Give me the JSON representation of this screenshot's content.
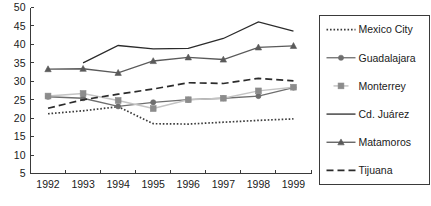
{
  "chart_data": {
    "type": "line",
    "title": "",
    "xlabel": "",
    "ylabel": "",
    "categories": [
      "1992",
      "1993",
      "1994",
      "1995",
      "1996",
      "1997",
      "1998",
      "1999"
    ],
    "x": [
      1992,
      1993,
      1994,
      1995,
      1996,
      1997,
      1998,
      1999
    ],
    "ylim": [
      5,
      50
    ],
    "yticks": [
      5,
      10,
      15,
      20,
      25,
      30,
      35,
      40,
      45,
      50
    ],
    "ytick_labels": [
      "5",
      "10",
      "15",
      "20",
      "25",
      "30",
      "35",
      "40",
      "45",
      "50"
    ],
    "grid": false,
    "legend_position": "right",
    "series": [
      {
        "name": "Mexico City",
        "values": [
          21.2,
          22.0,
          23.1,
          18.5,
          18.4,
          18.9,
          19.4,
          19.8
        ],
        "color": "#3a3a3a",
        "line_style": "dotted",
        "marker": "none"
      },
      {
        "name": "Guadalajara",
        "values": [
          25.8,
          25.4,
          23.2,
          24.3,
          25.0,
          25.4,
          26.0,
          28.3
        ],
        "color": "#6e6e6e",
        "line_style": "solid",
        "marker": "circle"
      },
      {
        "name": "Monterrey",
        "values": [
          26.0,
          26.7,
          24.8,
          22.6,
          25.0,
          25.4,
          27.4,
          28.4
        ],
        "color": "#c4c4c4",
        "line_style": "solid",
        "marker": "square"
      },
      {
        "name": "Cd. Juárez",
        "values": [
          null,
          35.0,
          39.7,
          38.8,
          38.9,
          41.6,
          46.1,
          43.6
        ],
        "color": "#2b2b2b",
        "line_style": "solid",
        "marker": "none"
      },
      {
        "name": "Matamoros",
        "values": [
          33.3,
          33.4,
          32.3,
          35.5,
          36.5,
          35.9,
          39.2,
          39.6
        ],
        "color": "#5a5a5a",
        "line_style": "solid",
        "marker": "triangle"
      },
      {
        "name": "Tijuana",
        "values": [
          22.7,
          25.0,
          26.5,
          27.9,
          29.6,
          29.4,
          30.8,
          30.1
        ],
        "color": "#2b2b2b",
        "line_style": "dashed",
        "marker": "none"
      }
    ]
  },
  "legend": {
    "entries": [
      {
        "label": "Mexico City"
      },
      {
        "label": "Guadalajara"
      },
      {
        "label": "Monterrey"
      },
      {
        "label": "Cd. Juárez"
      },
      {
        "label": "Matamoros"
      },
      {
        "label": "Tijuana"
      }
    ]
  },
  "axes": {
    "y_tick_labels": [
      "50",
      "45",
      "40",
      "35",
      "30",
      "25",
      "20",
      "15",
      "10",
      "5"
    ],
    "x_tick_labels": [
      "1992",
      "1993",
      "1994",
      "1995",
      "1996",
      "1997",
      "1998",
      "1999"
    ]
  },
  "colors": {
    "axis": "#3a3a3a",
    "text": "#1a1a1a",
    "background": "#ffffff",
    "legend_border": "#3a3a3a"
  }
}
